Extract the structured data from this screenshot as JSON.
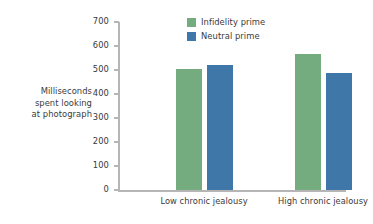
{
  "chart_data": {
    "type": "bar",
    "title": "",
    "xlabel": "",
    "ylabel": "Milliseconds spent looking at photograph",
    "ylabel_lines": [
      "Milliseconds",
      "spent looking",
      "at photograph"
    ],
    "categories": [
      "Low chronic jealousy",
      "High chronic jealousy"
    ],
    "series": [
      {
        "name": "Infidelity prime",
        "color": "#74ab7f",
        "values": [
          504,
          567
        ]
      },
      {
        "name": "Neutral prime",
        "color": "#3e77a8",
        "values": [
          521,
          488
        ]
      }
    ],
    "ylim": [
      0,
      700
    ],
    "ytick_values": [
      0,
      100,
      200,
      300,
      400,
      500,
      600,
      700
    ],
    "ytick_labels": [
      "0",
      "100",
      "200",
      "300",
      "400",
      "500",
      "600",
      "700"
    ],
    "grid": false,
    "legend_position": "top-center-right",
    "axis_color": "#b5b5b5",
    "text_color": "#3a3a3a",
    "background": "#ffffff"
  }
}
